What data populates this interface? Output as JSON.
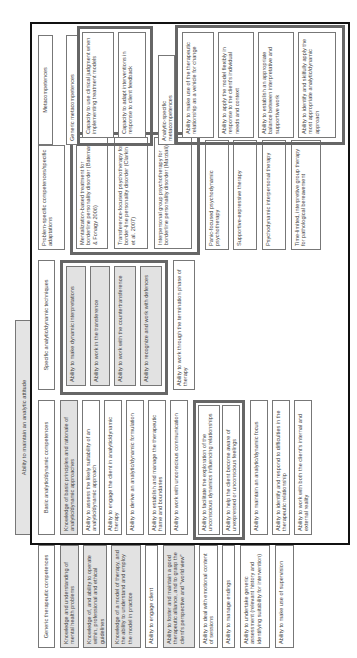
{
  "banner": {
    "label": "Ability to maintain an analytic attitude"
  },
  "generic": {
    "header": "Generic therapeutic competences",
    "items": [
      "Knowledge and understanding of mental health problems",
      "Knowledge of, and ability to operate within, professional and ethical guidelines",
      "Knowledge of a model of therapy, and the ability to understand and employ the model in practice",
      "Ability to engage client",
      "Ability to foster and maintain a good therapeutic alliance, and to grasp the client's perspective and \"world view\"",
      "Ability to deal with emotional content of sessions",
      "Ability to manage endings",
      "Ability to undertake generic assessment (relevant history and identifying suitability for intervention)",
      "Ability to make use of supervision"
    ]
  },
  "basic": {
    "header": "Basic analytic/dynamic competences",
    "items": [
      "Knowledge of basic principles and rationale of analytic/dynamic approaches",
      "Ability to assess the likely suitability of an analytic/dynamic approach",
      "Ability to engage the client in analytic/dynamic therapy",
      "Ability to derive an analytic/dynamic formulation",
      "Ability to establish and manage the therapeutic frame and boundaries",
      "Ability to work with unconscious communication"
    ],
    "group_items": [
      "Ability to facilitate the exploration of the unconscious dynamics influencing relationships",
      "Ability to help the client become aware of unexpressed or unconscious feelings"
    ],
    "more_items": [
      "Ability to maintain an analytic/dynamic focus",
      "Ability to identify and respond to difficulties in the therapeutic relationship",
      "Ability to work with both the client's internal and external reality"
    ]
  },
  "specific": {
    "header": "Specific analytic/dynamic techniques",
    "group_items": [
      "Ability to make dynamic interpretations",
      "Ability to work in the transference",
      "Ability to work with the countertransference",
      "Ability to recognize and work with defences"
    ],
    "other_items": [
      "Ability to work through the termination phase of therapy"
    ]
  },
  "problem": {
    "header": "Problem-specific competences/specific adaptations",
    "group_items": [
      "Mentalization-based treatment for borderline personality disorder (Bateman & Fonagy 2006)",
      "Transference-focused psychotherapy for border-line personality disorder (Clarkin et al. 2007)",
      "Interpersonal group psychotherapy for borderline personality disorder (Marziali)"
    ],
    "other_items": [
      "Panic-focused psychodynamic psychotherapy",
      "Supportive-expressive therapy",
      "Psychodynamic interpersonal therapy",
      "Time-limited, interpretive group therapy for pathological bereavement"
    ]
  },
  "meta": {
    "header": "Metacompetences",
    "generic_header": "Generic metacompetences",
    "generic_items": [
      "Capacity to use clinical judgment when implementing treatment models",
      "Capacity to adapt interventions in response to client feedback"
    ],
    "analytic_header": "Analytic-specific metacompetences",
    "analytic_items": [
      "Ability to make use of the therapeutic relationship as a vehicle for change",
      "Ability to apply the model flexibly in response to the client's individual needs and context",
      "Ability to establish an appropriate balance between interpretative and supportive work",
      "Ability to identify and skilfully apply the most appropriate analytic/dynamic approach"
    ]
  }
}
